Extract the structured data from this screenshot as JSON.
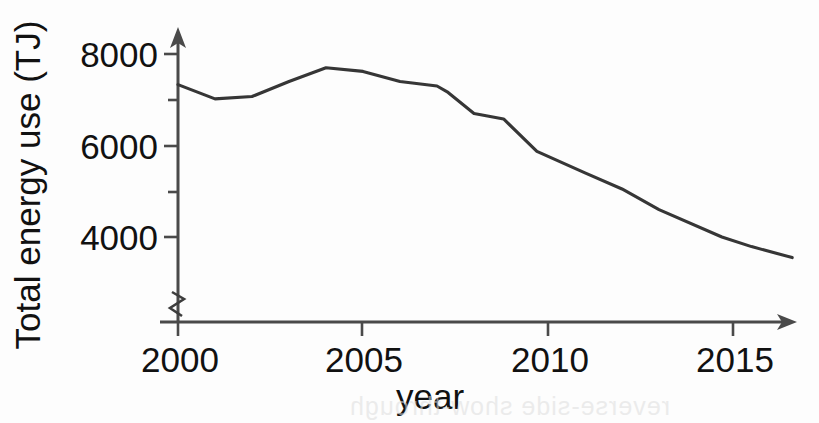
{
  "figure": {
    "background_color": "#ffffff",
    "line_color": "#363636",
    "axis_color": "#4a4a4a",
    "text_color": "#111111",
    "scan_artifact_text": "reverse-side show-through"
  },
  "axes": {
    "y_label": "Total energy use (TJ)",
    "x_label": "year",
    "y_major_ticks": [
      "8000",
      "6000",
      "4000"
    ],
    "y_minor_ticks": [
      "7000",
      "5000"
    ],
    "x_ticks": [
      "2000",
      "2005",
      "2010",
      "2015"
    ],
    "y_axis_broken": true,
    "break_symbol": "zigzag"
  },
  "chart_data": {
    "type": "line",
    "title": "",
    "xlabel": "year",
    "ylabel": "Total energy use (TJ)",
    "xlim": [
      2000,
      2016.6
    ],
    "ylim": [
      3400,
      8300
    ],
    "yticks": [
      4000,
      5000,
      6000,
      7000,
      8000
    ],
    "ytick_labels": [
      "4000",
      "",
      "6000",
      "",
      "8000"
    ],
    "xticks": [
      2000,
      2005,
      2010,
      2015
    ],
    "grid": false,
    "legend": false,
    "axis_break_y": true,
    "series": [
      {
        "name": "Total energy use",
        "x": [
          2000,
          2001,
          2002,
          2003,
          2004,
          2005,
          2006,
          2007,
          2007.3,
          2008,
          2008.8,
          2009.7,
          2011,
          2012,
          2013,
          2014.7,
          2015.5,
          2016.6
        ],
        "values": [
          7330,
          7020,
          7070,
          7400,
          7700,
          7620,
          7400,
          7300,
          7160,
          6700,
          6580,
          5870,
          5400,
          5050,
          4600,
          4000,
          3790,
          3550
        ]
      }
    ]
  }
}
